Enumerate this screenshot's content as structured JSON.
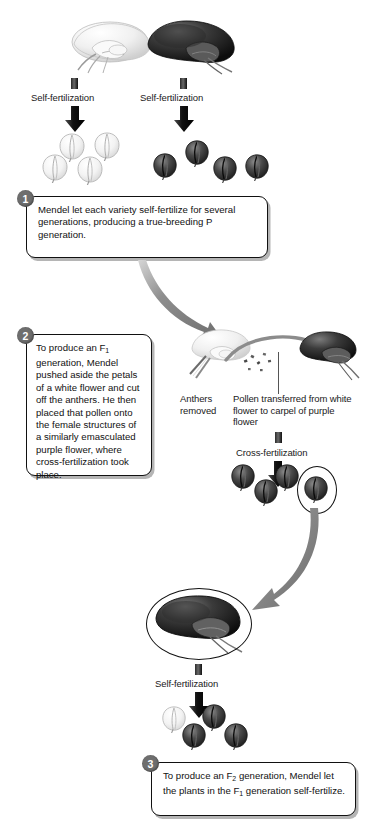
{
  "figure": {
    "background_color": "#ffffff"
  },
  "labels": {
    "self_fertilization_white_p": "Self-fertilization",
    "self_fertilization_purple_p": "Self-fertilization",
    "anthers_removed": "Anthers removed",
    "pollen_transferred": "Pollen transferred from white flower to carpel of purple flower",
    "cross_fertilization": "Cross-fertilization",
    "self_fertilization_f1": "Self-fertilization"
  },
  "steps": [
    {
      "number": "1",
      "text": "Mendel let each variety self-fertilize for several generations, producing a true-breeding P generation."
    },
    {
      "number": "2",
      "text_parts": [
        "To produce an F",
        "1",
        " generation, Mendel pushed aside the petals of a white flower and cut off the anthers. He then placed that pollen onto the female structures of a similarly emasculated purple flower, where cross-fertilization took place."
      ]
    },
    {
      "number": "3",
      "text_parts": [
        "To produce an F",
        "2",
        " generation, Mendel let the plants in the F",
        "1",
        " generation self-fertilize."
      ]
    }
  ],
  "generations": {
    "p_white": {
      "label": "P generation white variety",
      "flower_count": 4,
      "color": "white"
    },
    "p_purple": {
      "label": "P generation purple variety",
      "flower_count": 4,
      "color": "purple"
    },
    "f1": {
      "label": "F1 generation",
      "flower_count": 4,
      "color": "purple",
      "selected_index": 3
    },
    "f2": {
      "label": "F2 generation",
      "flower_count": 4,
      "white_count": 1,
      "purple_count": 3
    }
  },
  "colors": {
    "purple_flower": "#3a3a3a",
    "white_flower": "#f2f2f2",
    "arrow_gray": "#777777",
    "step_badge": "#6e6e6e",
    "outline": "#111111"
  }
}
